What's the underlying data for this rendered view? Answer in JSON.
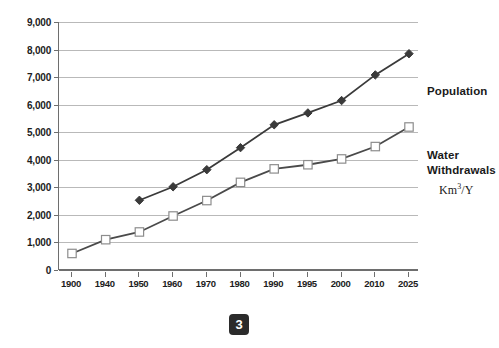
{
  "chart_data": {
    "type": "line",
    "title": "",
    "xlabel": "",
    "ylabel": "",
    "ylim": [
      0,
      9000
    ],
    "ytick_step": 1000,
    "grid": true,
    "legend_position": "right",
    "categories": [
      "1900",
      "1940",
      "1950",
      "1960",
      "1970",
      "1980",
      "1990",
      "1995",
      "2000",
      "2010",
      "2025"
    ],
    "yticks": [
      "0",
      "1,000",
      "2,000",
      "3,000",
      "4,000",
      "5,000",
      "6,000",
      "7,000",
      "8,000",
      "9,000"
    ],
    "series": [
      {
        "name": "Population",
        "marker": "filled-diamond",
        "color": "#3a3a3a",
        "values": [
          null,
          null,
          2530,
          3020,
          3640,
          4440,
          5270,
          5700,
          6150,
          7080,
          7850
        ]
      },
      {
        "name": "Water Withdrawals",
        "marker": "open-square",
        "color": "#4a4a4a",
        "values": [
          600,
          1100,
          1380,
          1960,
          2520,
          3180,
          3670,
          3820,
          4030,
          4480,
          5190
        ]
      }
    ],
    "annotations": [
      {
        "id": "population",
        "text": "Population"
      },
      {
        "id": "water_withdrawals",
        "text": "Water\nWithdrawals"
      },
      {
        "id": "unit",
        "text": "Km3/Y"
      }
    ]
  },
  "annotations": {
    "population_label": "Population",
    "water_label_line1": "Water",
    "water_label_line2": "Withdrawals",
    "unit_prefix": "Km",
    "unit_superscript": "3",
    "unit_suffix": "/Y"
  },
  "page": {
    "badge_number": "3"
  },
  "colors": {
    "population_series": "#3a3a3a",
    "water_series": "#4a4a4a",
    "gridline": "#b9b9b9",
    "axis": "#6e6e6e",
    "text": "#1c1c1c",
    "badge_background": "#2b2b2b"
  }
}
